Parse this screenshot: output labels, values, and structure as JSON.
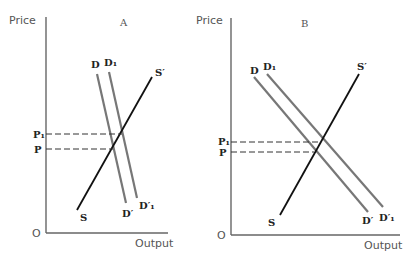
{
  "panels": [
    {
      "id": "A",
      "title": "A",
      "y_axis_label": "Price",
      "x_axis_label": "Output",
      "origin_label": "O",
      "price_labels": {
        "p1": "P₁",
        "p": "P"
      },
      "curves": {
        "d": {
          "top": "D",
          "bottom": "D′"
        },
        "d1": {
          "top": "D₁",
          "bottom": "D′₁"
        },
        "s": {
          "bottom": "S",
          "top": "S′"
        }
      }
    },
    {
      "id": "B",
      "title": "B",
      "y_axis_label": "Price",
      "x_axis_label": "Output",
      "origin_label": "O",
      "price_labels": {
        "p1": "P₁",
        "p": "P"
      },
      "curves": {
        "d": {
          "top": "D",
          "bottom": "D′"
        },
        "d1": {
          "top": "D₁",
          "bottom": "D′₁"
        },
        "s": {
          "bottom": "S",
          "top": "S′"
        }
      }
    }
  ],
  "colors": {
    "demand": "#777777",
    "supply": "#111111",
    "axis": "#666666"
  }
}
